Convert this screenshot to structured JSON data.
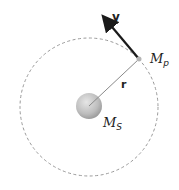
{
  "diagram": {
    "type": "circular-orbit",
    "labels": {
      "velocity": "v",
      "radius": "r",
      "planet_mass": "M",
      "planet_sub": "p",
      "star_mass": "M",
      "star_sub": "S"
    },
    "colors": {
      "orbit": "#9a9a9a",
      "radius_line": "#8a8a8a",
      "velocity_arrow": "#1a1a1a",
      "star_fill": "#bdbdbd",
      "planet_fill": "#b5b5b5"
    },
    "geometry": {
      "orbit_center": [
        89,
        107
      ],
      "orbit_radius": 69,
      "star_radius": 13,
      "planet_position": [
        139,
        59
      ],
      "velocity_tip": [
        104,
        17
      ]
    }
  }
}
